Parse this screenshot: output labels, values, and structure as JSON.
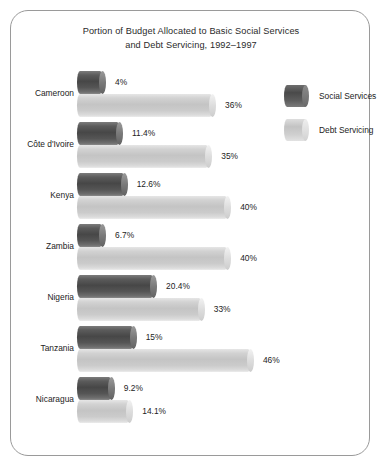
{
  "chart_data": {
    "type": "bar",
    "orientation": "horizontal",
    "title": "Portion of Budget Allocated to Basic Social Services and Debt Servicing, 1992–1997",
    "title_lines": [
      "Portion of Budget Allocated to Basic Social Services",
      "and Debt Servicing, 1992–1997"
    ],
    "xlabel": "",
    "ylabel": "",
    "grid": false,
    "legend_position": "right",
    "xlim": [
      0,
      46
    ],
    "categories": [
      "Cameroon",
      "Côte d'Ivoire",
      "Kenya",
      "Zambia",
      "Nigeria",
      "Tanzania",
      "Nicaragua"
    ],
    "series": [
      {
        "name": "Social Services",
        "color": "#4a4a4a",
        "values": [
          4,
          11.4,
          12.6,
          6.7,
          20.4,
          15,
          9.2
        ],
        "labels": [
          "4%",
          "11.4%",
          "12.6%",
          "6.7%",
          "20.4%",
          "15%",
          "9.2%"
        ]
      },
      {
        "name": "Debt Servicing",
        "color": "#c8c8c8",
        "values": [
          36,
          35,
          40,
          40,
          33,
          46,
          14.1
        ],
        "labels": [
          "36%",
          "35%",
          "40%",
          "40%",
          "33%",
          "46%",
          "14.1%"
        ]
      }
    ],
    "groups": [
      {
        "label": "Cameroon",
        "bars": [
          {
            "series": "Social Services",
            "value": 4,
            "label": "4%"
          },
          {
            "series": "Debt Servicing",
            "value": 36,
            "label": "36%"
          }
        ]
      },
      {
        "label": "Côte d'Ivoire",
        "bars": [
          {
            "series": "Social Services",
            "value": 11.4,
            "label": "11.4%"
          },
          {
            "series": "Debt Servicing",
            "value": 35,
            "label": "35%"
          }
        ]
      },
      {
        "label": "Kenya",
        "bars": [
          {
            "series": "Social Services",
            "value": 12.6,
            "label": "12.6%"
          },
          {
            "series": "Debt Servicing",
            "value": 40,
            "label": "40%"
          }
        ]
      },
      {
        "label": "Zambia",
        "bars": [
          {
            "series": "Social Services",
            "value": 6.7,
            "label": "6.7%"
          },
          {
            "series": "Debt Servicing",
            "value": 40,
            "label": "40%"
          }
        ]
      },
      {
        "label": "Nigeria",
        "bars": [
          {
            "series": "Social Services",
            "value": 20.4,
            "label": "20.4%"
          },
          {
            "series": "Debt Servicing",
            "value": 33,
            "label": "33%"
          }
        ]
      },
      {
        "label": "Tanzania",
        "bars": [
          {
            "series": "Social Services",
            "value": 15,
            "label": "15%"
          },
          {
            "series": "Debt Servicing",
            "value": 46,
            "label": "46%"
          }
        ]
      },
      {
        "label": "Nicaragua",
        "bars": [
          {
            "series": "Social Services",
            "value": 9.2,
            "label": "9.2%"
          },
          {
            "series": "Debt Servicing",
            "value": 14.1,
            "label": "14.1%"
          }
        ]
      }
    ]
  },
  "legend": {
    "items": [
      {
        "label": "Social Services",
        "swatch": "dark"
      },
      {
        "label": "Debt Servicing",
        "swatch": "light"
      }
    ]
  }
}
